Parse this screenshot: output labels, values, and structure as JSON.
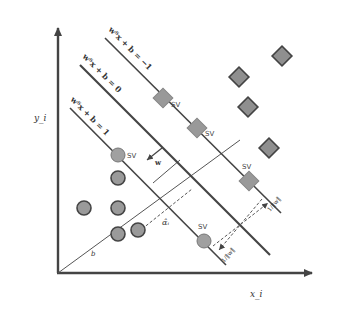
{
  "diagram": {
    "axes": {
      "x_label": "x_i",
      "y_label": "y_i"
    },
    "hyperplanes": [
      {
        "id": "neg",
        "label": "wᵀx + b = −1"
      },
      {
        "id": "mid",
        "label": "wᵀx + b = 0"
      },
      {
        "id": "pos",
        "label": "wᵀx + b = 1"
      }
    ],
    "annotations": {
      "sv": "SV",
      "w": "w",
      "alpha": "α̂ᵢ",
      "b": "b",
      "margin_upper": "1/‖w‖",
      "margin_lower": "1/‖w‖"
    },
    "colors": {
      "marker_fill": "#9a9a9a",
      "marker_stroke": "#444444",
      "line": "#444444",
      "axis": "#444444"
    },
    "class_circles": [
      {
        "x": 118,
        "y": 155,
        "sv": true
      },
      {
        "x": 118,
        "y": 178,
        "sv": false
      },
      {
        "x": 84,
        "y": 208,
        "sv": false
      },
      {
        "x": 118,
        "y": 208,
        "sv": false
      },
      {
        "x": 118,
        "y": 234,
        "sv": false
      },
      {
        "x": 138,
        "y": 230,
        "sv": false
      },
      {
        "x": 205,
        "y": 240,
        "sv": true
      }
    ],
    "class_diamonds": [
      {
        "x": 163,
        "y": 98,
        "sv": true
      },
      {
        "x": 197,
        "y": 128,
        "sv": true
      },
      {
        "x": 249,
        "y": 181,
        "sv": true
      },
      {
        "x": 282,
        "y": 55,
        "sv": false
      },
      {
        "x": 239,
        "y": 77,
        "sv": false
      },
      {
        "x": 248,
        "y": 107,
        "sv": false
      },
      {
        "x": 268,
        "y": 148,
        "sv": false
      }
    ]
  }
}
